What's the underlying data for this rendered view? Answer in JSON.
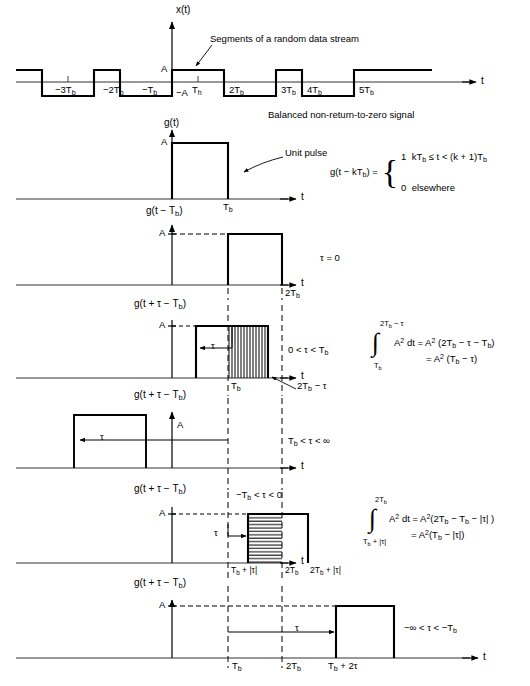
{
  "figure": {
    "axis_label_t": "t",
    "amp_label": "A",
    "neg_amp_label": "−A"
  },
  "panel1": {
    "name": "random-data-stream",
    "ylabel": "x(t)",
    "callout": "Segments of a random data stream",
    "caption": "Balanced non-return-to-zero signal",
    "tick_labels": [
      "−3T",
      "−2T",
      "−T",
      "T",
      "2T",
      "3T",
      "4T",
      "5T"
    ],
    "tick_subscripts": [
      "b",
      "b",
      "b",
      "h",
      "b",
      "b",
      "b",
      "b"
    ],
    "bit_pattern": [
      1,
      0,
      1,
      0,
      1,
      1,
      0,
      1,
      0,
      1
    ],
    "amp_label": "A",
    "neg_amp_label": "−A"
  },
  "panel2": {
    "name": "unit-pulse",
    "ylabel": "g(t)",
    "amp_label": "A",
    "tick_tb": "T",
    "tick_tb_sub": "b",
    "callout": "Unit pulse",
    "equation_lhs": "g(t − kT",
    "equation_lhs_sub": "b",
    "equation_lhs_end": ") =",
    "equation_case1_value": "1",
    "equation_case1_cond": "kT",
    "equation_case1_cond_sub": "b",
    "equation_case1_cond_mid": " ≤ t < (k + 1)T",
    "equation_case1_cond_sub2": "b",
    "equation_case2_value": "0",
    "equation_case2_cond": "elsewhere"
  },
  "panel3": {
    "name": "shifted-pulse-tau-zero",
    "ylabel": "g(t − T",
    "ylabel_sub": "b",
    "ylabel_end": ")",
    "amp_label": "A",
    "tick_2tb": "2T",
    "tick_2tb_sub": "b",
    "condition": "τ = 0"
  },
  "panel4": {
    "name": "overlap-positive-tau",
    "ylabel": "g(t + τ − T",
    "ylabel_sub": "b",
    "ylabel_end": ")",
    "amp_label": "A",
    "tau_label": "τ",
    "tick_tb": "T",
    "tick_tb_sub": "b",
    "tick_2tb_minus_tau": "2T",
    "tick_2tb_minus_tau_sub": "b",
    "tick_2tb_minus_tau_end": " − τ",
    "condition": "0 < τ < T",
    "condition_sub": "b",
    "integral_upper": "2T",
    "integral_upper_sub": "b",
    "integral_upper_end": " − τ",
    "integral_lower": "T",
    "integral_lower_sub": "b",
    "integrand": "A",
    "integrand_sup": "2",
    "integrand_dt": " dt = A",
    "integrand_dt_sup": "2",
    "result_line1": " (2T",
    "result_line1_sub": "b",
    "result_line1_end": " − τ − T",
    "result_line1_sub2": "b",
    "result_line1_close": ")",
    "result_line2": "= A",
    "result_line2_sup": "2",
    "result_line2_end": " (T",
    "result_line2_sub": "b",
    "result_line2_close": " − τ)",
    "hatch": "vertical"
  },
  "panel5": {
    "name": "no-overlap-large-tau",
    "ylabel": "g(t + τ − T",
    "ylabel_sub": "b",
    "ylabel_end": ")",
    "amp_label": "A",
    "tau_label": "τ",
    "condition": "T",
    "condition_sub": "b",
    "condition_end": " < τ < ∞"
  },
  "panel6": {
    "name": "overlap-negative-tau",
    "ylabel": "g(t + τ − T",
    "ylabel_sub": "b",
    "ylabel_end": ")",
    "amp_label": "A",
    "tau_label": "τ",
    "condition": "−T",
    "condition_sub": "b",
    "condition_end": " < τ < 0",
    "tick_tb_plus": "T",
    "tick_tb_plus_sub": "b",
    "tick_tb_plus_end": " + |τ|",
    "tick_2tb": "2T",
    "tick_2tb_sub": "b",
    "tick_2tb_plus": "2T",
    "tick_2tb_plus_sub": "b",
    "tick_2tb_plus_end": " + |τ|",
    "integral_upper": "2T",
    "integral_upper_sub": "b",
    "integral_lower": "T",
    "integral_lower_sub": "b",
    "integral_lower_end": " + |τ|",
    "integrand": "A",
    "integrand_sup": "2",
    "integrand_dt": " dt = A",
    "integrand_dt_sup": "2",
    "result_line1": "(2T",
    "result_line1_sub": "b",
    "result_line1_mid": " − T",
    "result_line1_sub2": "b",
    "result_line1_end": " − |τ| )",
    "result_line2": "= A",
    "result_line2_sup": "2",
    "result_line2_mid": "(T",
    "result_line2_sub": "b",
    "result_line2_end": " − |τ|)",
    "hatch": "horizontal"
  },
  "panel7": {
    "name": "no-overlap-negative-tau",
    "ylabel": "g(t + τ − T",
    "ylabel_sub": "b",
    "ylabel_end": ")",
    "amp_label": "A",
    "tau_label": "τ",
    "tick_tb": "T",
    "tick_tb_sub": "b",
    "tick_2tb": "2T",
    "tick_2tb_sub": "b",
    "tick_tb_plus_2tau": "T",
    "tick_tb_plus_2tau_sub": "b",
    "tick_tb_plus_2tau_end": " + 2τ",
    "condition": "−∞ < τ < −T",
    "condition_sub": "b"
  },
  "colors": {
    "line": "#000000",
    "axis": "#1a1a1a",
    "background": "#ffffff"
  }
}
